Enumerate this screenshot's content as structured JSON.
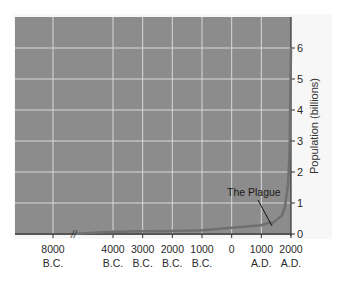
{
  "chart_data": {
    "type": "line",
    "title": "",
    "xlabel": "",
    "ylabel": "Population (billions)",
    "ylim": [
      0,
      7
    ],
    "yticks": [
      0,
      1,
      2,
      3,
      4,
      5,
      6
    ],
    "xtick_labels": [
      {
        "top": "8000",
        "bottom": "B.C."
      },
      {
        "top": "4000",
        "bottom": "B.C."
      },
      {
        "top": "3000",
        "bottom": "B.C."
      },
      {
        "top": "2000",
        "bottom": "B.C."
      },
      {
        "top": "1000",
        "bottom": "B.C."
      },
      {
        "top": "0",
        "bottom": ""
      },
      {
        "top": "1000",
        "bottom": "A.D."
      },
      {
        "top": "2000",
        "bottom": "A.D."
      }
    ],
    "axis_break": "//",
    "grid": true,
    "series": [
      {
        "name": "World population",
        "x": [
          -8000,
          -4000,
          -3000,
          -2000,
          -1000,
          0,
          1000,
          1300,
          1350,
          1500,
          1700,
          1800,
          1900,
          1950,
          2000
        ],
        "values": [
          0.005,
          0.07,
          0.09,
          0.1,
          0.12,
          0.2,
          0.28,
          0.38,
          0.33,
          0.45,
          0.6,
          0.9,
          1.6,
          2.5,
          6.0
        ]
      }
    ],
    "annotations": [
      {
        "text": "The Plague",
        "x": 1350,
        "y": 0.33
      }
    ],
    "colors": {
      "plot_bg": "#8c8c8c",
      "grid": "#d8d8d8",
      "line": "#6f6f6f",
      "text": "#2a2a2a"
    }
  }
}
